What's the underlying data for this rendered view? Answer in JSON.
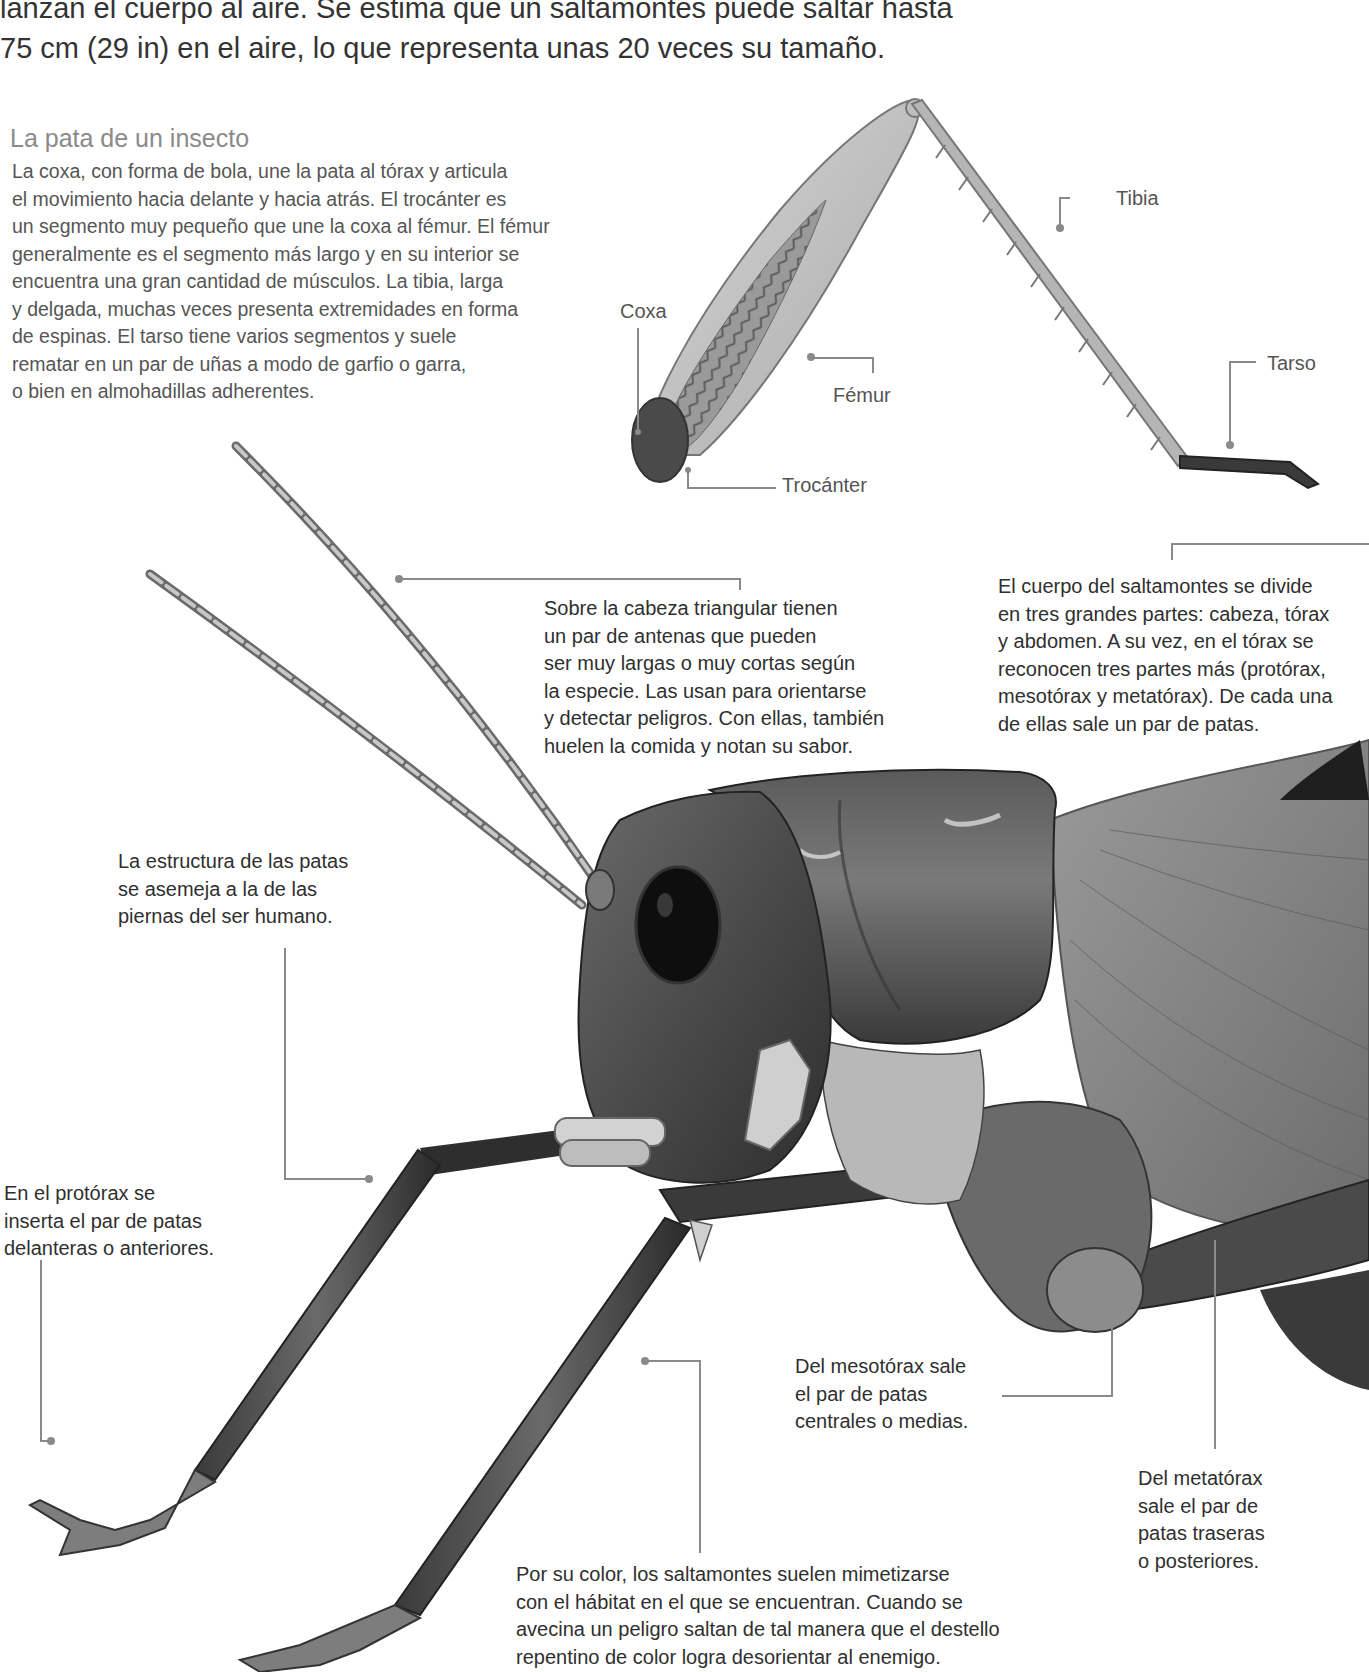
{
  "intro": {
    "lines": [
      "lanzan el cuerpo al aire. Se estima que un saltamontes puede saltar hasta",
      "75 cm (29 in) en el aire, lo que representa unas 20 veces su tamaño."
    ]
  },
  "leg_section": {
    "title": "La pata de un insecto",
    "lines": [
      "La coxa, con forma de bola, une la pata al tórax y articula",
      "el movimiento hacia delante y hacia atrás. El trocánter es",
      "un segmento muy pequeño que une la coxa al fémur. El fémur",
      "generalmente es el segmento más largo y en su interior se",
      "encuentra una gran cantidad de músculos. La tibia, larga",
      "y delgada, muchas veces presenta extremidades en forma",
      "de espinas. El tarso tiene varios segmentos y suele",
      "rematar en un par de uñas a modo de garfio o garra,",
      "o bien en almohadillas adherentes."
    ],
    "labels": {
      "coxa": "Coxa",
      "femur": "Fémur",
      "trocanter": "Trocánter",
      "tibia": "Tibia",
      "tarso": "Tarso"
    }
  },
  "captions": {
    "antenas": {
      "lines": [
        "Sobre la cabeza triangular tienen",
        "un par de antenas que pueden",
        "ser muy largas o muy cortas según",
        "la especie. Las usan para orientarse",
        "y detectar peligros. Con ellas, también",
        "huelen la comida y notan su sabor."
      ]
    },
    "cuerpo": {
      "lines": [
        "El cuerpo del saltamontes se divide",
        "en tres grandes partes: cabeza, tórax",
        "y abdomen. A su vez, en el tórax se",
        "reconocen tres partes más (protórax,",
        "mesotórax y metatórax). De cada una",
        "de ellas sale un par de patas."
      ]
    },
    "estructura": {
      "lines": [
        "La estructura de las patas",
        "se asemeja a la de las",
        "piernas del ser humano."
      ]
    },
    "protorax": {
      "lines": [
        "En el protórax se",
        "inserta el par de patas",
        "delanteras o anteriores."
      ]
    },
    "mesotorax": {
      "lines": [
        "Del mesotórax sale",
        "el par de patas",
        "centrales o medias."
      ]
    },
    "metatorax": {
      "lines": [
        "Del metatórax",
        "sale el par de",
        "patas traseras",
        "o posteriores."
      ]
    },
    "color": {
      "lines": [
        "Por su color, los saltamontes suelen mimetizarse",
        "con el hábitat en el que se encuentran. Cuando se",
        "avecina un peligro saltan de tal manera que el destello",
        "repentino de color logra desorientar al enemigo."
      ]
    }
  },
  "colors": {
    "leader_line": "#8a8a8a",
    "title_gray": "#8a8a8a",
    "body_text": "#2f2f2f"
  }
}
